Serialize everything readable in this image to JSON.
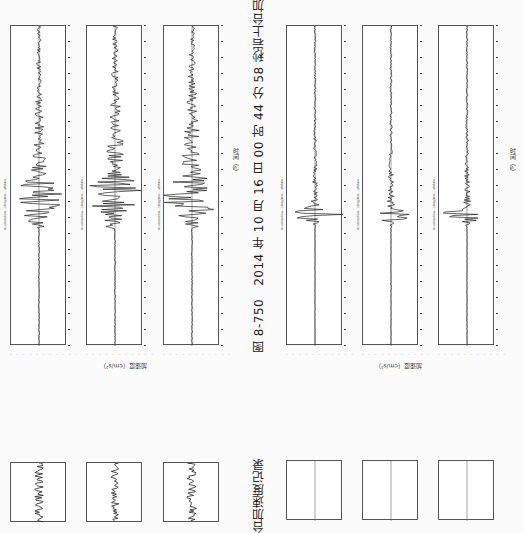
{
  "page": {
    "orientation": "rotated-90-ccw",
    "figure_number": "图 8-750",
    "caption": "2014 年 10 月 16 日 00 时 44 分 58 秒岩上台加速度记录",
    "caption_next_fragment": "台加速度记录"
  },
  "axes": {
    "time_label": "时间（s）",
    "accel_label": "加速度（cm/s²）"
  },
  "top_left_group": {
    "panels": [
      {
        "title": "Acceleration  ...(illegible)...  aMAX=...",
        "shape": "wide-burst"
      },
      {
        "title": "Acceleration  ...(illegible)...  aMAX=...",
        "shape": "wide-burst"
      },
      {
        "title": "Acceleration  ...(illegible)...  aMAX=...",
        "shape": "wide-burst"
      }
    ]
  },
  "top_right_group": {
    "panels": [
      {
        "title": "Acceleration  ...(illegible)...  aMAX=...",
        "shape": "sharp-spike"
      },
      {
        "title": "Acceleration  ...(illegible)...  aMAX=...",
        "shape": "sharp-spike"
      },
      {
        "title": "Acceleration  ...(illegible)...  aMAX=...",
        "shape": "sharp-spike"
      }
    ]
  },
  "ytick_text": "· · · · · · · · · · ·"
}
